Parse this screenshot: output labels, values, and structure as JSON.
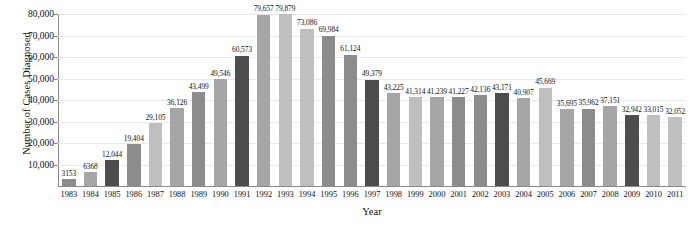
{
  "chart_data": {
    "type": "bar",
    "title": "",
    "xlabel": "Year",
    "ylabel": "Number of Cases Diagnosed",
    "ylim": [
      0,
      80000
    ],
    "ytick_labels": [
      "10,000",
      "20,000",
      "30,000",
      "40,000",
      "50,000",
      "60,000",
      "70,000",
      "80,000"
    ],
    "ytick_values": [
      10000,
      20000,
      30000,
      40000,
      50000,
      60000,
      70000,
      80000
    ],
    "grid": true,
    "legend": "none",
    "categories": [
      "1983",
      "1984",
      "1985",
      "1986",
      "1987",
      "1988",
      "1989",
      "1990",
      "1991",
      "1992",
      "1993",
      "1994",
      "1995",
      "1996",
      "1997",
      "1998",
      "1999",
      "2000",
      "2001",
      "2002",
      "2003",
      "2004",
      "2005",
      "2006",
      "2007",
      "2008",
      "2009",
      "2010",
      "2011"
    ],
    "values": [
      3153,
      6368,
      12044,
      19404,
      29105,
      36126,
      43499,
      49546,
      60573,
      79657,
      79879,
      73086,
      69984,
      61124,
      49379,
      43225,
      41314,
      41239,
      41227,
      42136,
      43171,
      40907,
      45669,
      35695,
      35962,
      37151,
      32942,
      33015,
      32052
    ],
    "data_labels": [
      "3153",
      "6368",
      "12,044",
      "19,404",
      "29,105",
      "36,126",
      "43,499",
      "49,546",
      "60,573",
      "79,657",
      "79,879",
      "73,086",
      "69,984",
      "61,124",
      "49,379",
      "43,225",
      "41,314",
      "41,239",
      "41,227",
      "42,136",
      "43,171",
      "40,907",
      "45,669",
      "35,695",
      "35,962",
      "37,151",
      "32,942",
      "33,015",
      "32,052"
    ],
    "bar_colors": [
      "#8c8c8c",
      "#a6a6a6",
      "#4d4d4d",
      "#8c8c8c",
      "#bfbfbf",
      "#a6a6a6",
      "#8c8c8c",
      "#a6a6a6",
      "#4d4d4d",
      "#a6a6a6",
      "#bfbfbf",
      "#bfbfbf",
      "#8c8c8c",
      "#8c8c8c",
      "#4d4d4d",
      "#a6a6a6",
      "#bfbfbf",
      "#a6a6a6",
      "#8c8c8c",
      "#8c8c8c",
      "#4d4d4d",
      "#a6a6a6",
      "#bfbfbf",
      "#a6a6a6",
      "#8c8c8c",
      "#a6a6a6",
      "#4d4d4d",
      "#bfbfbf",
      "#bfbfbf"
    ],
    "colors_note": {
      "dark": "#4d4d4d",
      "mid": "#8c8c8c",
      "light": "#a6a6a6",
      "lightest": "#bfbfbf",
      "gridline": "#e9e9e9",
      "axis": "#8a8a8a"
    }
  }
}
